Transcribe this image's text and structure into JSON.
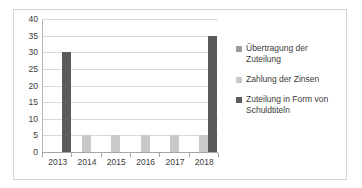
{
  "chart_data": {
    "type": "bar",
    "title": "",
    "subtitle": "",
    "xlabel": "",
    "ylabel": "",
    "categories": [
      "2013",
      "2014",
      "2015",
      "2016",
      "2017",
      "2018"
    ],
    "series": [
      {
        "name": "Übertragung der Zuteilung",
        "color": "#9c9c9c",
        "values": [
          0,
          0,
          0,
          0,
          0,
          0
        ]
      },
      {
        "name": "Zahlung der Zinsen",
        "color": "#c9c9c9",
        "values": [
          0,
          5,
          5,
          5,
          5,
          5
        ]
      },
      {
        "name": "Zuteilung in Form von Schuldtiteln",
        "color": "#5b5b5b",
        "values": [
          30,
          0,
          0,
          0,
          0,
          35
        ]
      }
    ],
    "ylim": [
      0,
      40
    ],
    "yticks": [
      0,
      5,
      10,
      15,
      20,
      25,
      30,
      35,
      40
    ],
    "ytick_labels": [
      "0",
      "5",
      "10",
      "15",
      "20",
      "25",
      "30",
      "35",
      "40"
    ],
    "grid": true,
    "legend_position": "right",
    "annotations": []
  },
  "colors": {
    "series_0": "#9c9c9c",
    "series_1": "#c9c9c9",
    "series_2": "#5b5b5b",
    "grid": "#d9d9d9",
    "axis": "#a6a6a6",
    "frame": "#d4d4d4",
    "text": "#3b3b3b",
    "background": "#ffffff"
  }
}
